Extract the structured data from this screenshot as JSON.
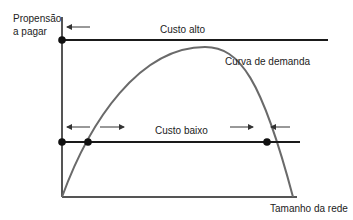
{
  "diagram": {
    "y_axis_label_line1": "Propensão",
    "y_axis_label_line2": "a pagar",
    "x_axis_label": "Tamanho da rede",
    "high_cost_label": "Custo alto",
    "low_cost_label": "Custo baixo",
    "demand_curve_label": "Curva de demanda",
    "colors": {
      "axis": "#555555",
      "cost_line": "#1a1a1a",
      "curve": "#6a6a6a",
      "dot": "#111111",
      "arrow": "#333333"
    }
  }
}
